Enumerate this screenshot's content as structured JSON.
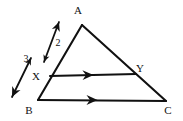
{
  "figure": {
    "type": "geometry-diagram",
    "background_color": "#ffffff",
    "stroke_color": "#111111",
    "vertices": [
      {
        "id": "A",
        "label": "A",
        "x": 82,
        "y": 25,
        "label_x": 78,
        "label_y": 14
      },
      {
        "id": "B",
        "label": "B",
        "x": 38,
        "y": 100,
        "label_x": 29,
        "label_y": 114
      },
      {
        "id": "C",
        "label": "C",
        "x": 166,
        "y": 101,
        "label_x": 168,
        "label_y": 114
      },
      {
        "id": "X",
        "label": "X",
        "x": 50,
        "y": 76,
        "label_x": 36,
        "label_y": 80
      },
      {
        "id": "Y",
        "label": "Y",
        "x": 136,
        "y": 74,
        "label_x": 140,
        "label_y": 72
      }
    ],
    "edges": [
      {
        "id": "AB",
        "from": "A",
        "to": "B",
        "x1": 82,
        "y1": 25,
        "x2": 38,
        "y2": 100
      },
      {
        "id": "AC",
        "from": "A",
        "to": "C",
        "x1": 82,
        "y1": 25,
        "x2": 166,
        "y2": 101
      },
      {
        "id": "BC",
        "from": "B",
        "to": "C",
        "x1": 38,
        "y1": 100,
        "x2": 166,
        "y2": 101
      },
      {
        "id": "XY",
        "from": "X",
        "to": "Y",
        "x1": 50,
        "y1": 76,
        "x2": 136,
        "y2": 74
      }
    ],
    "parallel_marks": [
      {
        "id": "mark-xy",
        "on_edge": "XY",
        "glyph": "single-arrowhead",
        "x": 88,
        "y": 75,
        "angle": -1.3
      },
      {
        "id": "mark-bc",
        "on_edge": "BC",
        "glyph": "single-arrowhead",
        "x": 92,
        "y": 100,
        "angle": 0.4
      }
    ],
    "measure_arrows": [
      {
        "id": "measure-upper",
        "label": "2",
        "label_x": 58,
        "label_y": 46,
        "spans": "X to A",
        "double_headed": true,
        "x1": 44,
        "y1": 62,
        "x2": 59,
        "y2": 22
      },
      {
        "id": "measure-lower",
        "label": "3",
        "label_x": 26,
        "label_y": 62,
        "spans": "B to X",
        "double_headed": true,
        "x1": 31,
        "y1": 58,
        "x2": 12,
        "y2": 97
      }
    ]
  }
}
